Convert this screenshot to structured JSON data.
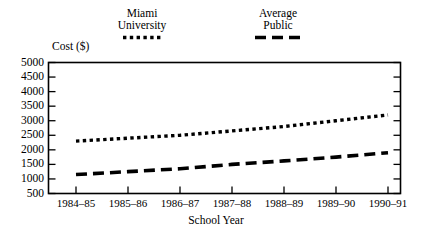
{
  "chart_data": {
    "type": "line",
    "title": "",
    "xlabel": "School Year",
    "ylabel": "Cost ($)",
    "categories": [
      "1984–85",
      "1985–86",
      "1986–87",
      "1987–88",
      "1988–89",
      "1989–90",
      "1990–91"
    ],
    "ylim": [
      500,
      5000
    ],
    "ytick_values": [
      500,
      1000,
      1500,
      2000,
      2500,
      3000,
      3500,
      4000,
      4500,
      5000
    ],
    "ytick_labels": [
      "500",
      "1000",
      "1500",
      "2000",
      "2500",
      "3000",
      "3500",
      "4000",
      "4500",
      "5000"
    ],
    "grid": false,
    "legend_position": "top",
    "series": [
      {
        "name": "Miami University",
        "style": "dotted",
        "color": "#000000",
        "values": [
          2300,
          2400,
          2500,
          2650,
          2800,
          3000,
          3200
        ]
      },
      {
        "name": "Average Public",
        "style": "dashed",
        "color": "#000000",
        "values": [
          1150,
          1250,
          1350,
          1500,
          1620,
          1750,
          1900
        ]
      }
    ]
  },
  "legend": {
    "miami": {
      "line1": "Miami",
      "line2": "University",
      "marker": "dotted-line-swatch"
    },
    "public": {
      "line1": "Average",
      "line2": "Public",
      "marker": "dashed-line-swatch"
    }
  },
  "axes": {
    "y_title": "Cost ($)",
    "x_title": "School Year"
  }
}
